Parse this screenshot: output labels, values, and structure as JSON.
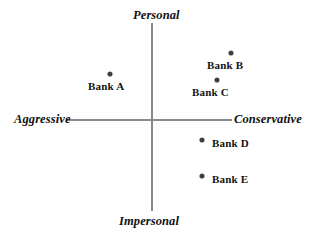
{
  "chart_data": {
    "type": "scatter",
    "title": "",
    "subtitle": "",
    "xlabel": "",
    "ylabel": "",
    "grid": false,
    "legend": "none",
    "axis_style": "crossed-quadrant perceptual map",
    "xlim": [
      -1,
      1
    ],
    "ylim": [
      -1,
      1
    ],
    "axis_poles": {
      "top": "Personal",
      "bottom": "Impersonal",
      "left": "Aggressive",
      "right": "Conservative"
    },
    "points": [
      {
        "label": "Bank A",
        "x": -0.51,
        "y": 0.49,
        "label_position": "below"
      },
      {
        "label": "Bank B",
        "x": 0.95,
        "y": 0.71,
        "label_position": "below"
      },
      {
        "label": "Bank C",
        "x": 0.78,
        "y": 0.43,
        "label_position": "below"
      },
      {
        "label": "Bank D",
        "x": 0.6,
        "y": -0.21,
        "label_position": "right"
      },
      {
        "label": "Bank E",
        "x": 0.6,
        "y": -0.59,
        "label_position": "right"
      }
    ],
    "colors": {
      "point": "#3c3c3c",
      "axis": "#8a8a8a",
      "text": "#141414",
      "background": "#ffffff"
    }
  },
  "points_px": [
    {
      "dot_left": 108,
      "dot_top": 72,
      "label_left": 88,
      "label_top": 80
    },
    {
      "dot_left": 229,
      "dot_top": 51,
      "label_left": 207,
      "label_top": 59
    },
    {
      "dot_left": 215,
      "dot_top": 78,
      "label_left": 192,
      "label_top": 86
    },
    {
      "dot_left": 200,
      "dot_top": 138,
      "label_left": 212,
      "label_top": 137
    },
    {
      "dot_left": 200,
      "dot_top": 174,
      "label_left": 212,
      "label_top": 173
    }
  ]
}
